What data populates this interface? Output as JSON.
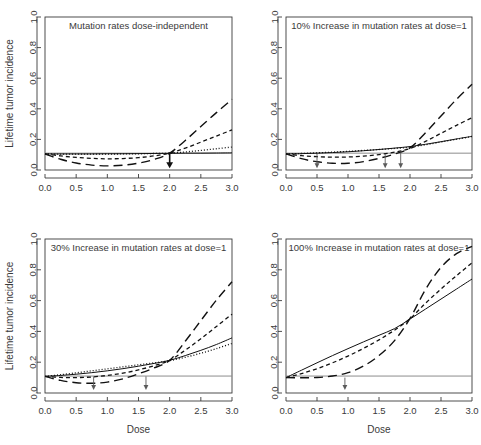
{
  "figure": {
    "y_axis_label": "Lifetime tumor incidence",
    "x_axis_label": "Dose",
    "x_ticks": [
      "0.0",
      "0.5",
      "1.0",
      "1.5",
      "2.0",
      "2.5",
      "3.0"
    ],
    "y_ticks": [
      "0.0",
      "0.2",
      "0.4",
      "0.6",
      "0.8",
      "1.0"
    ],
    "background_color": "#ffffff",
    "axis_color": "#3a3a3a",
    "curve_color": "#111111",
    "reference_line_color": "#8c8c8c",
    "arrow_color": "#5a5a5a"
  },
  "chart_data": [
    {
      "type": "line",
      "panel": 1,
      "title": "Mutation rates dose-independent",
      "xlabel": "",
      "ylabel": "Lifetime tumor incidence",
      "xlim": [
        0.0,
        3.0
      ],
      "ylim": [
        0.0,
        1.0
      ],
      "grid": false,
      "legend": "none",
      "background_incidence": 0.11,
      "x": [
        0.0,
        0.25,
        0.5,
        0.75,
        1.0,
        1.25,
        1.5,
        1.75,
        2.0,
        2.25,
        2.5,
        2.75,
        3.0
      ],
      "series": [
        {
          "name": "solid",
          "style": "solid",
          "values": [
            0.105,
            0.105,
            0.105,
            0.105,
            0.106,
            0.106,
            0.107,
            0.108,
            0.109,
            0.11,
            0.11,
            0.111,
            0.112
          ]
        },
        {
          "name": "dotted",
          "style": "dotted",
          "values": [
            0.105,
            0.104,
            0.104,
            0.104,
            0.104,
            0.105,
            0.106,
            0.108,
            0.11,
            0.118,
            0.128,
            0.139,
            0.15
          ]
        },
        {
          "name": "short-dash",
          "style": "short-dash",
          "values": [
            0.105,
            0.092,
            0.082,
            0.076,
            0.073,
            0.075,
            0.081,
            0.092,
            0.11,
            0.143,
            0.182,
            0.222,
            0.262
          ]
        },
        {
          "name": "long-dash",
          "style": "long-dash",
          "values": [
            0.105,
            0.07,
            0.046,
            0.032,
            0.027,
            0.031,
            0.045,
            0.069,
            0.11,
            0.193,
            0.284,
            0.375,
            0.462
          ]
        }
      ],
      "arrows": [
        {
          "x": 2.0,
          "y_top": 0.115,
          "y_bottom": 0.012,
          "emphasis": "bold"
        }
      ]
    },
    {
      "type": "line",
      "panel": 2,
      "title": "10% Increase in mutation rates at dose=1",
      "xlabel": "",
      "ylabel": "",
      "xlim": [
        0.0,
        3.0
      ],
      "ylim": [
        0.0,
        1.0
      ],
      "grid": false,
      "legend": "none",
      "background_incidence": 0.11,
      "x": [
        0.0,
        0.25,
        0.5,
        0.75,
        1.0,
        1.25,
        1.5,
        1.75,
        2.0,
        2.25,
        2.5,
        2.75,
        3.0
      ],
      "series": [
        {
          "name": "solid",
          "style": "solid",
          "values": [
            0.105,
            0.107,
            0.11,
            0.114,
            0.119,
            0.126,
            0.134,
            0.143,
            0.153,
            0.168,
            0.185,
            0.203,
            0.22
          ]
        },
        {
          "name": "dotted",
          "style": "dotted",
          "values": [
            0.105,
            0.108,
            0.112,
            0.117,
            0.122,
            0.128,
            0.134,
            0.141,
            0.149,
            0.165,
            0.183,
            0.201,
            0.219
          ]
        },
        {
          "name": "short-dash",
          "style": "short-dash",
          "values": [
            0.105,
            0.094,
            0.087,
            0.084,
            0.085,
            0.091,
            0.101,
            0.117,
            0.14,
            0.187,
            0.24,
            0.292,
            0.342
          ]
        },
        {
          "name": "long-dash",
          "style": "long-dash",
          "values": [
            0.105,
            0.074,
            0.054,
            0.044,
            0.044,
            0.055,
            0.076,
            0.104,
            0.145,
            0.243,
            0.353,
            0.462,
            0.56
          ]
        }
      ],
      "arrows": [
        {
          "x": 0.5,
          "y_top": 0.105,
          "y_bottom": 0.012,
          "emphasis": "normal"
        },
        {
          "x": 1.6,
          "y_top": 0.105,
          "y_bottom": 0.012,
          "emphasis": "normal"
        },
        {
          "x": 1.85,
          "y_top": 0.115,
          "y_bottom": 0.012,
          "emphasis": "normal"
        }
      ]
    },
    {
      "type": "line",
      "panel": 3,
      "title": "30% Increase in mutation rates at dose=1",
      "xlabel": "Dose",
      "ylabel": "Lifetime tumor incidence",
      "xlim": [
        0.0,
        3.0
      ],
      "ylim": [
        0.0,
        1.0
      ],
      "grid": false,
      "legend": "none",
      "background_incidence": 0.11,
      "x": [
        0.0,
        0.25,
        0.5,
        0.75,
        1.0,
        1.25,
        1.5,
        1.75,
        2.0,
        2.25,
        2.5,
        2.75,
        3.0
      ],
      "series": [
        {
          "name": "solid",
          "style": "solid",
          "values": [
            0.108,
            0.114,
            0.122,
            0.132,
            0.144,
            0.158,
            0.174,
            0.192,
            0.212,
            0.243,
            0.277,
            0.315,
            0.358
          ]
        },
        {
          "name": "dotted",
          "style": "dotted",
          "values": [
            0.108,
            0.119,
            0.131,
            0.144,
            0.157,
            0.17,
            0.183,
            0.196,
            0.21,
            0.232,
            0.258,
            0.288,
            0.322
          ]
        },
        {
          "name": "short-dash",
          "style": "short-dash",
          "values": [
            0.108,
            0.101,
            0.1,
            0.104,
            0.114,
            0.129,
            0.15,
            0.177,
            0.212,
            0.278,
            0.352,
            0.432,
            0.512
          ]
        },
        {
          "name": "long-dash",
          "style": "long-dash",
          "values": [
            0.108,
            0.082,
            0.067,
            0.063,
            0.071,
            0.092,
            0.125,
            0.163,
            0.212,
            0.336,
            0.47,
            0.603,
            0.722
          ]
        }
      ],
      "arrows": [
        {
          "x": 0.78,
          "y_top": 0.108,
          "y_bottom": 0.02,
          "emphasis": "normal"
        },
        {
          "x": 1.62,
          "y_top": 0.108,
          "y_bottom": 0.02,
          "emphasis": "normal"
        }
      ]
    },
    {
      "type": "line",
      "panel": 4,
      "title": "100% Increase in mutation rates at dose=1",
      "xlabel": "Dose",
      "ylabel": "",
      "xlim": [
        0.0,
        3.0
      ],
      "ylim": [
        0.0,
        1.0
      ],
      "grid": false,
      "legend": "none",
      "background_incidence": 0.11,
      "x": [
        0.0,
        0.25,
        0.5,
        0.75,
        1.0,
        1.25,
        1.5,
        1.75,
        2.0,
        2.25,
        2.5,
        2.75,
        3.0
      ],
      "series": [
        {
          "name": "solid",
          "style": "solid",
          "values": [
            0.1,
            0.148,
            0.196,
            0.243,
            0.288,
            0.332,
            0.375,
            0.418,
            0.48,
            0.545,
            0.61,
            0.675,
            0.74
          ]
        },
        {
          "name": "short-dash",
          "style": "short-dash",
          "values": [
            0.1,
            0.126,
            0.158,
            0.196,
            0.24,
            0.29,
            0.345,
            0.408,
            0.482,
            0.583,
            0.675,
            0.762,
            0.845
          ]
        },
        {
          "name": "long-dash",
          "style": "long-dash",
          "values": [
            0.1,
            0.099,
            0.101,
            0.11,
            0.132,
            0.175,
            0.243,
            0.34,
            0.484,
            0.672,
            0.816,
            0.905,
            0.952
          ]
        }
      ],
      "arrows": [
        {
          "x": 0.95,
          "y_top": 0.1,
          "y_bottom": 0.02,
          "emphasis": "normal"
        }
      ]
    }
  ]
}
